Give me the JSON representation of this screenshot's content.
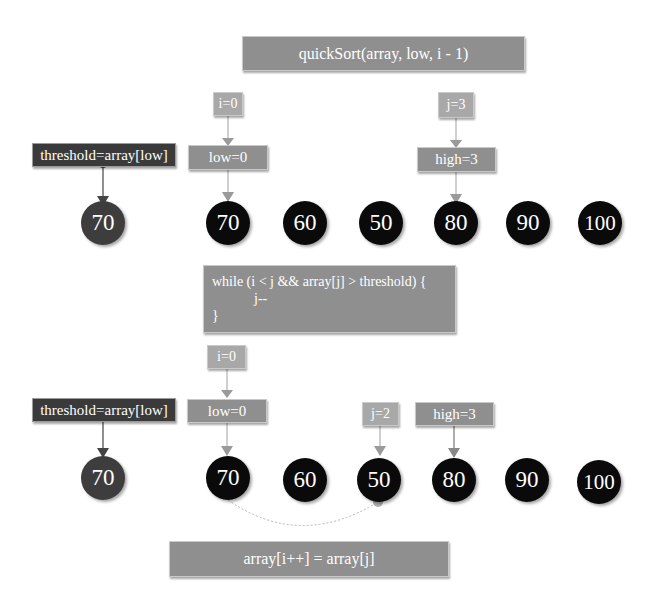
{
  "colors": {
    "label_gray": "#8f8f8f",
    "pointer_gray": "#a8a8a8",
    "threshold_dark": "#3a3a3a",
    "node_black": "#0a0a0a",
    "pivot_node": "#3d3d3d",
    "arrow_gray": "#a0a0a0",
    "arrow_dark": "#404040"
  },
  "top_caption": "quickSort(array, low, i - 1)",
  "step1": {
    "threshold_label": "threshold=array[low]",
    "pivot_value": "70",
    "i_pointer": "i=0",
    "low_label": "low=0",
    "j_pointer": "j=3",
    "high_label": "high=3",
    "array": [
      "70",
      "60",
      "50",
      "80",
      "90",
      "100"
    ]
  },
  "code_block": {
    "line1": "while (i < j && array[j] > threshold) {",
    "line2": "            j--",
    "line3": "}"
  },
  "step2": {
    "threshold_label": "threshold=array[low]",
    "pivot_value": "70",
    "i_pointer": "i=0",
    "low_label": "low=0",
    "j_pointer": "j=2",
    "high_label": "high=3",
    "array": [
      "70",
      "60",
      "50",
      "80",
      "90",
      "100"
    ]
  },
  "bottom_caption": "array[i++] = array[j]"
}
